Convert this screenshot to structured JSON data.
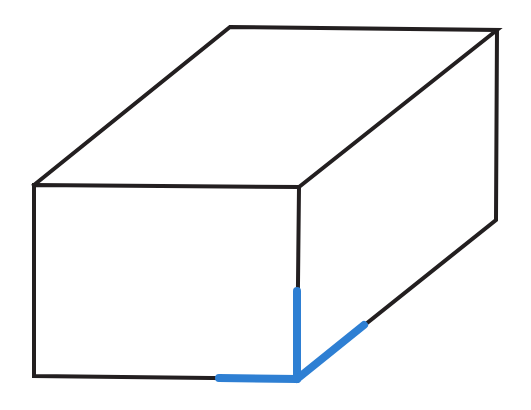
{
  "diagram": {
    "type": "rectangular-prism-line-drawing",
    "colors": {
      "edge": "#231f20",
      "highlight": "#2e7fd3",
      "background": "#ffffff"
    },
    "vertices": {
      "front_top_left": [
        34,
        185
      ],
      "front_top_right": [
        299,
        187
      ],
      "front_bottom_left": [
        34,
        376
      ],
      "front_bottom_right": [
        297,
        379
      ],
      "back_top_left": [
        230,
        27
      ],
      "back_top_right": [
        497,
        30
      ],
      "back_bottom_right": [
        496,
        220
      ]
    },
    "highlighted_edges": [
      {
        "name": "bottom-edge-segment",
        "from": [
          219,
          378
        ],
        "to": [
          297,
          379
        ]
      },
      {
        "name": "vertical-edge-segment",
        "from": [
          297,
          291
        ],
        "to": [
          297,
          379
        ]
      },
      {
        "name": "depth-edge-segment",
        "from": [
          297,
          379
        ],
        "to": [
          364,
          325
        ]
      }
    ],
    "description": "Box with three edges meeting at the front bottom-right vertex highlighted in blue"
  }
}
